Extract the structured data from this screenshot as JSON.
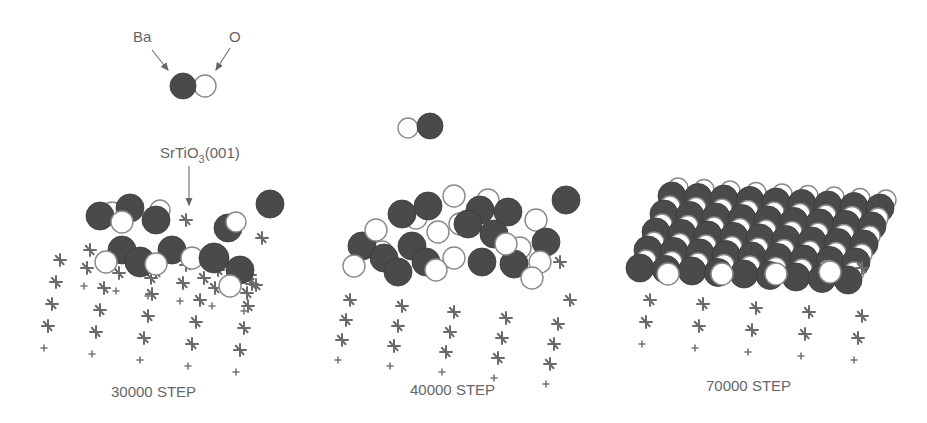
{
  "figure": {
    "legend": {
      "ba_label": "Ba",
      "o_label": "O"
    },
    "substrate_label": {
      "main": "SrTiO",
      "subscript": "3",
      "suffix": "(001)"
    },
    "panels": [
      {
        "caption": "30000 STEP"
      },
      {
        "caption": "40000 STEP"
      },
      {
        "caption": "70000 STEP"
      }
    ],
    "colors": {
      "ba_atom": "#4a4a4a",
      "o_atom": "#ffffff",
      "substrate": "#6a6a6a",
      "text": "#666666"
    }
  }
}
